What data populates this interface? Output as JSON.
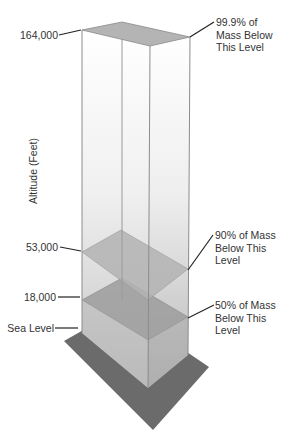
{
  "diagram": {
    "axis_title": "Altitude (Feet)",
    "altitude_labels": [
      {
        "text": "164,000",
        "y": 30
      },
      {
        "text": "53,000",
        "y": 248
      },
      {
        "text": "18,000",
        "y": 297
      },
      {
        "text": "Sea Level",
        "y": 327
      }
    ],
    "annotations": [
      {
        "lines": [
          "99.9% of",
          "Mass Below",
          "This Level"
        ],
        "level": "164,000"
      },
      {
        "lines": [
          "90% of Mass",
          "Below This",
          "Level"
        ],
        "level": "53,000"
      },
      {
        "lines": [
          "50% of Mass",
          "Below This",
          "Level"
        ],
        "level": "18,000"
      }
    ],
    "colors": {
      "column_top": "#ffffff",
      "column_mid": "#e4e4e4",
      "column_low": "#c4c4c4",
      "plane_top": "#b4b4b4",
      "plane_90": "#b0b0b0",
      "plane_50": "#9a9a9a",
      "ground": "#6a6a6a",
      "edge": "#8a8a8a",
      "leader": "#222222"
    }
  }
}
